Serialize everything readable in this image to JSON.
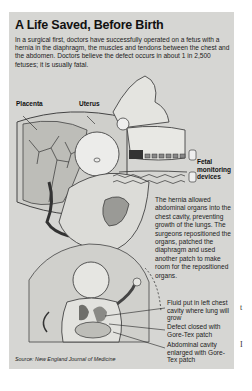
{
  "figure": {
    "title": "A Life Saved, Before Birth",
    "intro": "In a surgical first, doctors have successfully operated on a fetus with a hernia in the diaphragm, the muscles and tendons between the chest and the abdomen. Doctors believe the defect occurs in about 1 in 2,500 fetuses; it is usually fatal.",
    "labels": {
      "placenta": "Placenta",
      "uterus": "Uterus",
      "fetal_monitoring": "Fetal monitoring devices"
    },
    "explanation": "The hernia allowed abdominal organs into the chest cavity, preventing growth of the lungs. The surgeons repositioned the organs, patched the diaphragm and used another patch to make room for the repositioned organs.",
    "callouts": [
      "Fluid put in left chest cavity where lung will grow",
      "Defect closed with Gore-Tex patch",
      "Abdominal cavity enlarged with Gore-Tex patch"
    ],
    "source": "Source: New England Journal of Medicine"
  },
  "page_margin": {
    "fragment_1": "t",
    "fragment_2": "I"
  }
}
